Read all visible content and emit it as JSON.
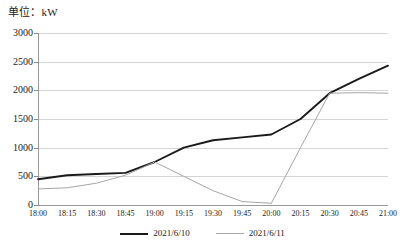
{
  "chart_data": {
    "type": "line",
    "title": "单位：kW",
    "xlabel": "",
    "ylabel": "",
    "ylim": [
      0,
      3000
    ],
    "ytick_step": 500,
    "grid": true,
    "legend_position": "bottom",
    "x": [
      "18:00",
      "18:15",
      "18:30",
      "18:45",
      "19:00",
      "19:15",
      "19:30",
      "19:45",
      "20:00",
      "20:15",
      "20:30",
      "20:45",
      "21:00"
    ],
    "yticks": [
      "0",
      "500",
      "1000",
      "1500",
      "2000",
      "2500",
      "3000"
    ],
    "series": [
      {
        "name": "2021/6/10",
        "color": "#1a1a1a",
        "values": [
          450,
          520,
          540,
          560,
          750,
          1000,
          1130,
          1180,
          1230,
          1500,
          1950,
          2200,
          2430
        ]
      },
      {
        "name": "2021/6/11",
        "color": "#a6a6a6",
        "values": [
          280,
          300,
          380,
          520,
          750,
          500,
          250,
          60,
          30,
          1000,
          1950,
          1960,
          1950
        ]
      }
    ]
  },
  "legend": {
    "items": [
      {
        "label": "2021/6/10"
      },
      {
        "label": "2021/6/11"
      }
    ]
  }
}
